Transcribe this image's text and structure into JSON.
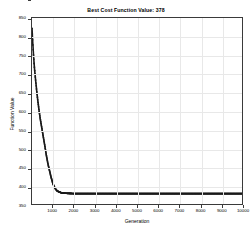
{
  "chart_data": {
    "type": "line",
    "title": "Best Cost Function Value: 378",
    "xlabel": "Generation",
    "ylabel": "Function Value",
    "xlim": [
      0,
      10000
    ],
    "ylim": [
      350,
      850
    ],
    "xticks": [
      1000,
      2000,
      3000,
      4000,
      5000,
      6000,
      7000,
      8000,
      9000,
      10000
    ],
    "yticks": [
      350,
      400,
      450,
      500,
      550,
      600,
      650,
      700,
      750,
      800,
      850
    ],
    "grid": true,
    "legend": null,
    "best_value": 378,
    "series": [
      {
        "name": "Best Cost",
        "marker": "dot",
        "color": "#1a1a1a",
        "x": [
          0,
          10,
          20,
          30,
          40,
          50,
          60,
          70,
          80,
          90,
          100,
          120,
          140,
          160,
          180,
          200,
          220,
          240,
          260,
          280,
          300,
          330,
          360,
          390,
          420,
          450,
          480,
          510,
          540,
          570,
          600,
          640,
          680,
          720,
          760,
          800,
          850,
          900,
          950,
          1000,
          1100,
          1200,
          1400,
          1600,
          1800,
          2000,
          2500,
          3000,
          3500,
          4000,
          4500,
          5000,
          5500,
          6000,
          6500,
          7000,
          7500,
          8000,
          8500,
          9000,
          9500,
          10000
        ],
        "y": [
          822,
          812,
          800,
          790,
          780,
          772,
          762,
          752,
          744,
          736,
          728,
          714,
          702,
          690,
          678,
          668,
          656,
          646,
          636,
          626,
          618,
          604,
          592,
          580,
          570,
          560,
          550,
          540,
          530,
          520,
          510,
          496,
          482,
          470,
          458,
          448,
          436,
          424,
          414,
          404,
          392,
          385,
          380,
          379,
          378.5,
          378,
          378,
          378,
          378,
          378,
          378,
          378,
          378,
          378,
          378,
          378,
          378,
          378,
          378,
          378,
          378,
          378
        ]
      }
    ]
  }
}
